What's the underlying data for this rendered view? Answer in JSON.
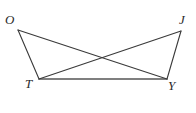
{
  "figure": {
    "background_color": "#ffffff",
    "stroke_color": "#3a3a3a",
    "base_stroke_color": "#555555",
    "label_color": "#2b2b2b",
    "vertices": [
      {
        "id": "O",
        "label": "O",
        "x": 18,
        "y": 30
      },
      {
        "id": "J",
        "label": "J",
        "x": 181,
        "y": 31
      },
      {
        "id": "T",
        "label": "T",
        "x": 39,
        "y": 79
      },
      {
        "id": "Y",
        "label": "Y",
        "x": 167,
        "y": 79
      }
    ],
    "segments": [
      {
        "id": "OT",
        "from": "O",
        "to": "T",
        "x1": 18,
        "y1": 30,
        "x2": 39,
        "y2": 79,
        "width": 1.1
      },
      {
        "id": "JY",
        "from": "J",
        "to": "Y",
        "x1": 181,
        "y1": 31,
        "x2": 167,
        "y2": 79,
        "width": 1.1
      },
      {
        "id": "TY",
        "from": "T",
        "to": "Y",
        "x1": 39,
        "y1": 79,
        "x2": 167,
        "y2": 79,
        "width": 1.4
      },
      {
        "id": "OY",
        "from": "O",
        "to": "Y",
        "x1": 18,
        "y1": 30,
        "x2": 167,
        "y2": 79,
        "width": 1.1
      },
      {
        "id": "TJ",
        "from": "T",
        "to": "J",
        "x1": 39,
        "y1": 79,
        "x2": 181,
        "y2": 31,
        "width": 1.1
      }
    ],
    "intersection": {
      "id": "OY-TJ-crossing",
      "x": 101,
      "y": 58
    }
  }
}
